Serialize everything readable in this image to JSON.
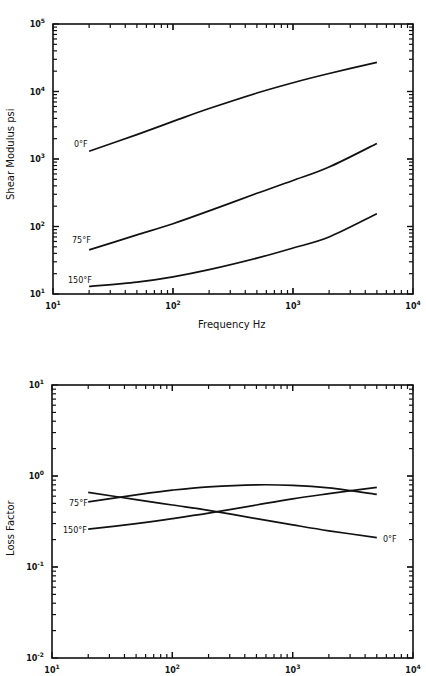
{
  "chart_data": [
    {
      "type": "line",
      "title": "",
      "xlabel": "Frequency Hz",
      "ylabel": "Shear Modulus psi",
      "xscale": "log",
      "yscale": "log",
      "xlim": [
        10,
        10000
      ],
      "ylim": [
        10,
        100000
      ],
      "grid": false,
      "legend": "inline labels at left end of curves",
      "x_tick_labels": [
        "10^1",
        "10^2",
        "10^3",
        "10^4"
      ],
      "y_tick_labels": [
        "10^1",
        "10^2",
        "10^3",
        "10^4",
        "10^5"
      ],
      "x": [
        20,
        50,
        100,
        200,
        500,
        1000,
        2000,
        5000
      ],
      "series": [
        {
          "name": "0°F",
          "values": [
            1300,
            2300,
            3600,
            5600,
            9500,
            13500,
            18500,
            27000
          ]
        },
        {
          "name": "75°F",
          "values": [
            45,
            75,
            110,
            170,
            310,
            480,
            760,
            1700
          ]
        },
        {
          "name": "150°F",
          "values": [
            13,
            15,
            18,
            23,
            34,
            48,
            70,
            155
          ]
        }
      ]
    },
    {
      "type": "line",
      "title": "",
      "xlabel": "",
      "ylabel": "Loss Factor",
      "xscale": "log",
      "yscale": "log",
      "xlim": [
        10,
        10000
      ],
      "ylim": [
        0.01,
        10
      ],
      "grid": false,
      "legend": "inline labels at curve ends",
      "x_tick_labels": [
        "10^1",
        "10^2",
        "10^3",
        "10^4"
      ],
      "y_tick_labels": [
        "10^-2",
        "10^-1",
        "10^0",
        "10^1"
      ],
      "x": [
        20,
        50,
        100,
        200,
        500,
        1000,
        2000,
        5000
      ],
      "series": [
        {
          "name": "0°F",
          "values": [
            0.66,
            0.55,
            0.48,
            0.42,
            0.34,
            0.29,
            0.25,
            0.21
          ]
        },
        {
          "name": "75°F",
          "values": [
            0.52,
            0.62,
            0.7,
            0.76,
            0.8,
            0.79,
            0.74,
            0.63
          ]
        },
        {
          "name": "150°F",
          "values": [
            0.26,
            0.3,
            0.34,
            0.39,
            0.48,
            0.56,
            0.64,
            0.75
          ]
        }
      ]
    }
  ],
  "charts": {
    "top": {
      "ylabel": "Shear Modulus psi",
      "xlabel": "Frequency Hz",
      "labels": {
        "s0": "0°F",
        "s1": "75°F",
        "s2": "150°F"
      }
    },
    "bottom": {
      "ylabel": "Loss Factor",
      "labels": {
        "s0": "0°F",
        "s1": "75°F",
        "s2": "150°F"
      }
    }
  }
}
